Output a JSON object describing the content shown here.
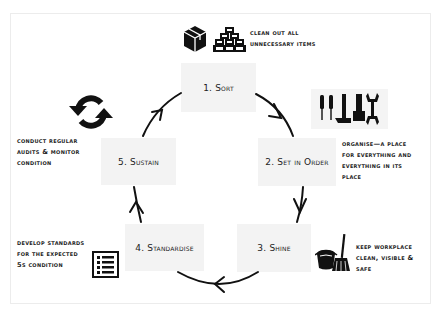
{
  "diagram": {
    "steps": [
      {
        "id": "sort",
        "label": "1. Sort",
        "description": "Clean out all unnecessary items",
        "icons": [
          "box-icon",
          "stacked-boxes-icon"
        ]
      },
      {
        "id": "set-in-order",
        "label": "2. Set in Order",
        "description": "Organise—A place for everything and everything in its place",
        "icons": [
          "tools-icon"
        ]
      },
      {
        "id": "shine",
        "label": "3. Shine",
        "description": "Keep workplace clean, visible & safe",
        "icons": [
          "bucket-broom-icon"
        ]
      },
      {
        "id": "standardise",
        "label": "4. Standardise",
        "description": "Develop standards for the expected 5S condition",
        "icons": [
          "checklist-icon"
        ]
      },
      {
        "id": "sustain",
        "label": "5. Sustain",
        "description": "Conduct regular audits & monitor condition",
        "icons": [
          "refresh-cycle-icon"
        ]
      }
    ],
    "flow": [
      "1. Sort → 2. Set in Order",
      "2. Set in Order → 3. Shine",
      "3. Shine → 4. Standardise",
      "4. Standardise → 5. Sustain",
      "5. Sustain → 1. Sort"
    ],
    "notes": {
      "sort": [
        "Clean out all",
        "unnecessary items"
      ],
      "set_in_order": [
        "Organise—A place",
        "for everything and",
        "everything in its",
        "place"
      ],
      "shine": [
        "Keep workplace",
        "clean, visible &",
        "safe"
      ],
      "standardise": [
        "Develop standards",
        "for the expected",
        "5S condition"
      ],
      "sustain": [
        "Conduct regular",
        "audits & monitor",
        "condition"
      ]
    },
    "colors": {
      "box_fill": "#f3f3f3",
      "ink": "#111111",
      "frame": "#ececec"
    }
  }
}
